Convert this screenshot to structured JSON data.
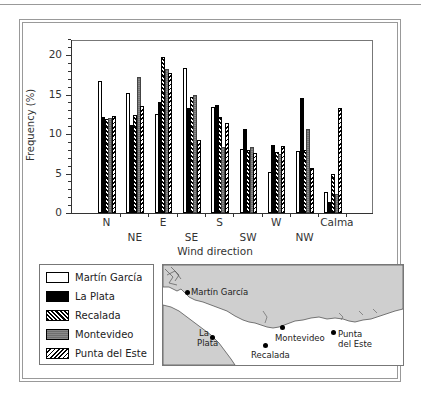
{
  "chart_data": {
    "type": "bar",
    "title": "",
    "xlabel": "Wind direction",
    "ylabel": "Frequency (%)",
    "ylim": [
      0,
      22
    ],
    "yticks": [
      0,
      5,
      10,
      15,
      20
    ],
    "grid": false,
    "legend_position": "bottom-left (separate box)",
    "categories": [
      "N",
      "NE",
      "E",
      "SE",
      "S",
      "SW",
      "W",
      "NW",
      "Calma"
    ],
    "series": [
      {
        "name": "Martín García",
        "pattern": "white",
        "values": [
          16.7,
          15.2,
          12.5,
          18.3,
          13.4,
          8.1,
          5.2,
          7.8,
          2.6
        ]
      },
      {
        "name": "La Plata",
        "pattern": "black",
        "values": [
          12.2,
          11.1,
          14.0,
          13.3,
          13.7,
          10.6,
          8.6,
          14.6,
          1.4
        ]
      },
      {
        "name": "Recalada",
        "pattern": "diagonal-hatch",
        "values": [
          11.9,
          12.4,
          19.8,
          14.7,
          12.2,
          8.0,
          7.7,
          8.0,
          4.9
        ]
      },
      {
        "name": "Montevideo",
        "pattern": "grey-fill",
        "values": [
          12.0,
          17.2,
          18.2,
          15.0,
          8.3,
          8.3,
          7.5,
          10.6,
          2.4
        ]
      },
      {
        "name": "Punta del Este",
        "pattern": "reverse-diagonal-hatch",
        "values": [
          12.3,
          13.5,
          17.7,
          9.3,
          11.4,
          7.6,
          8.5,
          5.7,
          13.3
        ]
      }
    ]
  },
  "axis": {
    "y_title": "Frequency (%)",
    "x_title": "Wind direction",
    "y_ticks": [
      "0",
      "5",
      "10",
      "15",
      "20"
    ],
    "x_labels": [
      "N",
      "NE",
      "E",
      "SE",
      "S",
      "SW",
      "W",
      "NW",
      "Calma"
    ]
  },
  "legend": {
    "items": [
      {
        "label": "Martín García"
      },
      {
        "label": "La Plata"
      },
      {
        "label": "Recalada"
      },
      {
        "label": "Montevideo"
      },
      {
        "label": "Punta del Este"
      }
    ]
  },
  "map": {
    "stations": [
      {
        "label": "Martín García"
      },
      {
        "label": "La Plata"
      },
      {
        "label": "Recalada"
      },
      {
        "label": "Montevideo"
      },
      {
        "label": "Punta del Este"
      }
    ],
    "land_color": "#cfcfcf",
    "water_color": "#ffffff"
  }
}
